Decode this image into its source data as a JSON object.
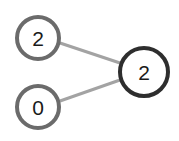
{
  "diagram": {
    "type": "graph",
    "nodes": [
      {
        "id": "n1",
        "label": "2",
        "cx": 38,
        "cy": 38,
        "r": 21,
        "stroke": "#6b6b6b"
      },
      {
        "id": "n2",
        "label": "0",
        "cx": 38,
        "cy": 107,
        "r": 21,
        "stroke": "#6b6b6b"
      },
      {
        "id": "n3",
        "label": "2",
        "cx": 144,
        "cy": 72,
        "r": 24,
        "stroke": "#2e2e2e"
      }
    ],
    "edges": [
      {
        "from": "n1",
        "to": "n3",
        "color": "#a0a0a0"
      },
      {
        "from": "n2",
        "to": "n3",
        "color": "#a0a0a0"
      }
    ]
  }
}
